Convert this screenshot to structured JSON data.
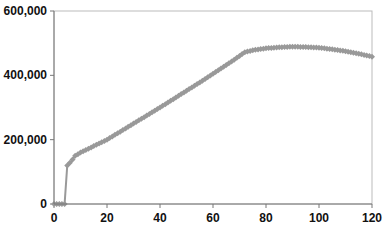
{
  "chart_data": {
    "type": "line",
    "title": "",
    "xlabel": "",
    "ylabel": "",
    "xlim": [
      0,
      120
    ],
    "ylim": [
      0,
      600000
    ],
    "x_ticks": [
      "0",
      "20",
      "40",
      "60",
      "80",
      "100",
      "120"
    ],
    "y_ticks": [
      "0",
      "200,000",
      "400,000",
      "600,000"
    ],
    "grid": false,
    "legend": null,
    "series": [
      {
        "name": "series-1",
        "color": "#999999",
        "marker": "diamond",
        "x": [
          0,
          1,
          2,
          3,
          4,
          5,
          6,
          7,
          8,
          9,
          10,
          12,
          15,
          20,
          25,
          30,
          35,
          40,
          45,
          50,
          55,
          60,
          65,
          70,
          72,
          75,
          80,
          85,
          90,
          95,
          100,
          105,
          110,
          115,
          120
        ],
        "values": [
          0,
          0,
          0,
          0,
          0,
          120000,
          128000,
          138000,
          150000,
          155000,
          160000,
          168000,
          180000,
          200000,
          225000,
          250000,
          275000,
          300000,
          326000,
          352000,
          378000,
          405000,
          432000,
          460000,
          472000,
          478000,
          484000,
          487000,
          489000,
          488000,
          486000,
          481000,
          475000,
          467000,
          458000
        ]
      }
    ]
  }
}
